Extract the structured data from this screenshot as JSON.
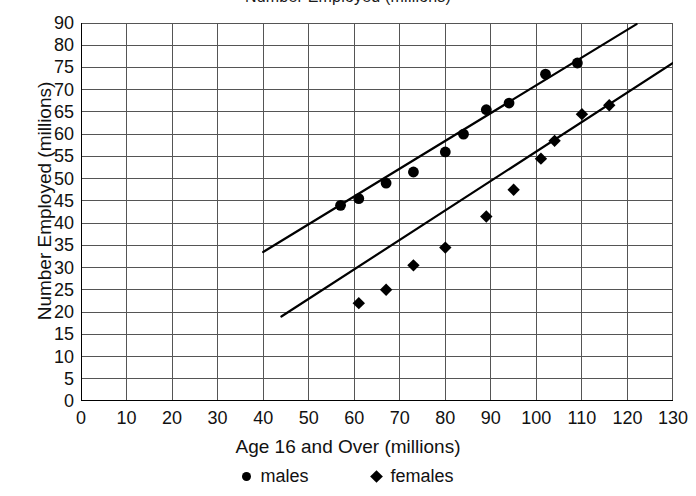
{
  "chart_data": {
    "type": "scatter",
    "title": "Number Employed (millions)",
    "xlabel": "Age 16 and Over (millions)",
    "ylabel": "Number Employed (millions)",
    "xlim": [
      0,
      130
    ],
    "ylim": [
      0,
      90
    ],
    "grid": true,
    "legend_position": "bottom",
    "xticks": [
      "0",
      "10",
      "20",
      "30",
      "40",
      "50",
      "60",
      "70",
      "80",
      "90",
      "100",
      "110",
      "120",
      "130"
    ],
    "yticks": [
      "90",
      "80",
      "75",
      "70",
      "65",
      "60",
      "55",
      "50",
      "45",
      "40",
      "35",
      "30",
      "25",
      "20",
      "15",
      "10",
      "5",
      "0"
    ],
    "series": [
      {
        "name": "males",
        "marker": "circle",
        "color": "#000000",
        "points": [
          {
            "x": 57,
            "y": 44
          },
          {
            "x": 61,
            "y": 45.5
          },
          {
            "x": 67,
            "y": 49
          },
          {
            "x": 73,
            "y": 51.5
          },
          {
            "x": 80,
            "y": 56
          },
          {
            "x": 84,
            "y": 60
          },
          {
            "x": 89,
            "y": 65.5
          },
          {
            "x": 94,
            "y": 67
          },
          {
            "x": 102,
            "y": 73.5
          },
          {
            "x": 109,
            "y": 76
          }
        ],
        "trendline": {
          "x1": 40,
          "y1": 33.5,
          "x2": 122,
          "y2": 89.5
        }
      },
      {
        "name": "females",
        "marker": "diamond",
        "color": "#000000",
        "points": [
          {
            "x": 61,
            "y": 22
          },
          {
            "x": 67,
            "y": 25
          },
          {
            "x": 73,
            "y": 30.5
          },
          {
            "x": 80,
            "y": 34.5
          },
          {
            "x": 89,
            "y": 41.5
          },
          {
            "x": 95,
            "y": 47.5
          },
          {
            "x": 101,
            "y": 54.5
          },
          {
            "x": 104,
            "y": 58.5
          },
          {
            "x": 110,
            "y": 64.5
          },
          {
            "x": 116,
            "y": 66.5
          }
        ],
        "trendline": {
          "x1": 44,
          "y1": 19,
          "x2": 130,
          "y2": 76
        }
      }
    ],
    "legend": [
      {
        "label": "males",
        "marker": "circle"
      },
      {
        "label": "females",
        "marker": "diamond"
      }
    ]
  }
}
